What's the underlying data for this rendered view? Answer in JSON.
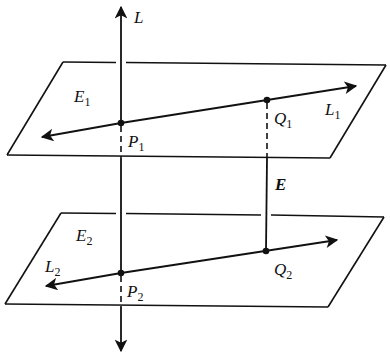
{
  "diagram": {
    "colors": {
      "stroke": "#111111",
      "background": "#ffffff"
    },
    "planes": [
      {
        "id": "E1",
        "label": "E",
        "subscript": "1"
      },
      {
        "id": "E2",
        "label": "E",
        "subscript": "2"
      }
    ],
    "lines": [
      {
        "id": "L",
        "label": "L",
        "subscript": ""
      },
      {
        "id": "L1",
        "label": "L",
        "subscript": "1"
      },
      {
        "id": "L2",
        "label": "L",
        "subscript": "2"
      }
    ],
    "points": [
      {
        "id": "P1",
        "label": "P",
        "subscript": "1"
      },
      {
        "id": "Q1",
        "label": "Q",
        "subscript": "1"
      },
      {
        "id": "P2",
        "label": "P",
        "subscript": "2"
      },
      {
        "id": "Q2",
        "label": "Q",
        "subscript": "2"
      }
    ],
    "segment": {
      "id": "E",
      "label": "E"
    }
  }
}
